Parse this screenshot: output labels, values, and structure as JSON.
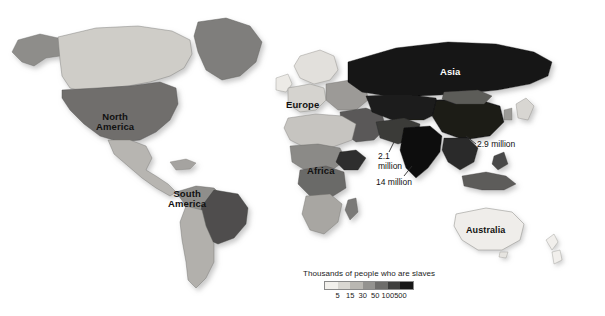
{
  "map": {
    "title": "World map of slavery prevalence",
    "background_color": "#ffffff",
    "continent_labels": [
      {
        "id": "north-america",
        "text": "North\nAmerica",
        "color": "#111111"
      },
      {
        "id": "south-america",
        "text": "South\nAmerica",
        "color": "#111111"
      },
      {
        "id": "europe",
        "text": "Europe",
        "color": "#111111"
      },
      {
        "id": "africa",
        "text": "Africa",
        "color": "#111111"
      },
      {
        "id": "asia",
        "text": "Asia",
        "color": "#ffffff"
      },
      {
        "id": "australia",
        "text": "Australia",
        "color": "#111111"
      }
    ],
    "callouts": [
      {
        "id": "callout-21",
        "text": "2.1\nmillion"
      },
      {
        "id": "callout-14",
        "text": "14 million"
      },
      {
        "id": "callout-29",
        "text": "2.9 million"
      }
    ]
  },
  "legend": {
    "title": "Thousands of people who are slaves",
    "tick_labels": [
      "5",
      "15",
      "30",
      "50",
      "100",
      "500"
    ],
    "swatch_colors": [
      "#f2f0ec",
      "#d9d7d2",
      "#b9b7b2",
      "#949390",
      "#6e6d6b",
      "#3e3e3d",
      "#171717"
    ]
  },
  "chart_data": {
    "type": "heatmap",
    "title": "Thousands of people who are slaves",
    "subtitle": "",
    "xlabel": "",
    "ylabel": "",
    "class_breaks": [
      5,
      15,
      30,
      50,
      100,
      500
    ],
    "class_colors": [
      "#f2f0ec",
      "#d9d7d2",
      "#b9b7b2",
      "#949390",
      "#6e6d6b",
      "#3e3e3d",
      "#171717"
    ],
    "annotations": [
      "2.1 million",
      "14 million",
      "2.9 million"
    ],
    "legend_position": "bottom-center",
    "grid": false,
    "regions": [
      {
        "name": "Asia",
        "class": 7,
        "value_label": "2.9 million"
      },
      {
        "name": "India",
        "class": 7,
        "value_label": "14 million"
      },
      {
        "name": "Pakistan",
        "class": 6,
        "value_label": "2.1 million"
      },
      {
        "name": "Africa",
        "class": 5,
        "value_label": ""
      },
      {
        "name": "South America",
        "class": 5,
        "value_label": ""
      },
      {
        "name": "North America",
        "class": 4,
        "value_label": ""
      },
      {
        "name": "Europe",
        "class": 3,
        "value_label": ""
      },
      {
        "name": "Australia",
        "class": 1,
        "value_label": ""
      }
    ]
  }
}
